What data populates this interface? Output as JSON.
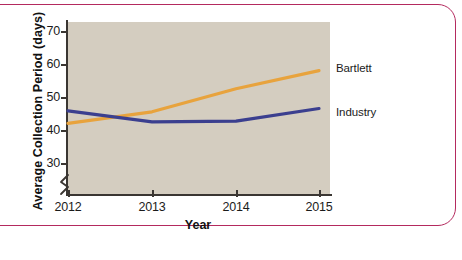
{
  "figure": {
    "panel_color": "#d4cdc0",
    "frame_color": "#b42a5e",
    "axis_color": "#3a3632"
  },
  "chart_data": {
    "type": "line",
    "title": "",
    "xlabel": "Year",
    "ylabel": "Average Collection Period (days)",
    "x": [
      2012,
      2013,
      2014,
      2015
    ],
    "xtick_labels": [
      "2012",
      "2013",
      "2014",
      "2015"
    ],
    "ytick_labels": [
      "30",
      "40",
      "50",
      "60",
      "70"
    ],
    "yticks": [
      30,
      40,
      50,
      60,
      70
    ],
    "ylim": [
      25,
      73
    ],
    "xlim": [
      2011.85,
      2015.25
    ],
    "axis_break": true,
    "grid": false,
    "legend_position": "right-inline-labels",
    "series": [
      {
        "name": "Bartlett",
        "color": "#e8a33d",
        "values": [
          42.0,
          45.5,
          52.5,
          58.0
        ],
        "label": "Bartlett"
      },
      {
        "name": "Industry",
        "color": "#3b3f8f",
        "values": [
          45.8,
          42.5,
          42.7,
          46.5
        ],
        "label": "Industry"
      }
    ]
  },
  "labels": {
    "bartlett": "Bartlett",
    "industry": "Industry",
    "year": "Year",
    "avg_collection": "Average Collection Period (days)",
    "y30": "30",
    "y40": "40",
    "y50": "50",
    "y60": "60",
    "y70": "70",
    "x2012": "2012",
    "x2013": "2013",
    "x2014": "2014",
    "x2015": "2015"
  }
}
